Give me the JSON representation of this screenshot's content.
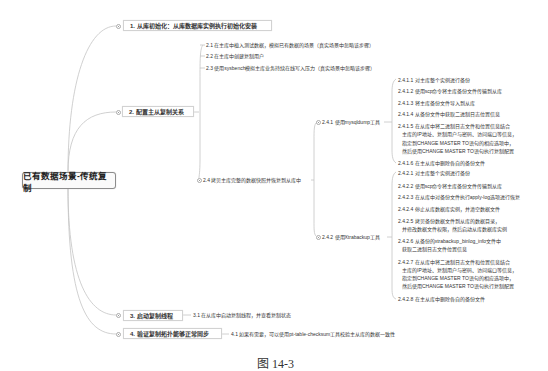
{
  "root": {
    "label": "已有数据场景-传统复制"
  },
  "branches": [
    {
      "label": "1. 从库初始化：从库数据库实例执行初始化安装"
    },
    {
      "label": "2. 配置主从复制关系",
      "children": [
        {
          "label": "2.1 在主库中植入测试数据，模拟已有数据的场景（真实场景中忽略该步骤）"
        },
        {
          "label": "2.2 在主库中创建复制用户"
        },
        {
          "label": "2.3 使用sysbench模拟主库业务持续在线写入压力（真实场景中忽略该步骤）"
        },
        {
          "label": "2.4 拷贝主库完整的数据快照并恢复到从库中",
          "children": [
            {
              "label": "2.4.1 使用mysqldump工具",
              "children": [
                {
                  "lines": [
                    "2.4.1.1 对主库整个实例进行备份"
                  ]
                },
                {
                  "lines": [
                    "2.4.1.2 使用scp命令将主库备份文件传输到从库"
                  ]
                },
                {
                  "lines": [
                    "2.4.1.3 将主库备份文件导入到从库"
                  ]
                },
                {
                  "lines": [
                    "2.4.1.4 从备份文件中获取二进制日志位置信息"
                  ]
                },
                {
                  "lines": [
                    "2.4.1.5 在从库中将二进制日志文件和位置信息结合",
                    "主库的IP地址、复制用户与密码、访问端口等信息，",
                    "指定到CHANGE MASTER TO语句的相应选项中，",
                    "然后使用CHANGE MASTER TO语句执行复制配置"
                  ]
                },
                {
                  "lines": [
                    "2.4.1.6 在主从库中删除各自的备份文件"
                  ]
                }
              ]
            },
            {
              "label": "2.4.2 使用Xtrabackup工具",
              "children": [
                {
                  "lines": [
                    "2.4.2.1 对主库整个实例进行备份"
                  ]
                },
                {
                  "lines": [
                    "2.4.2.2 使用scp命令将主库备份文件传输到从库"
                  ]
                },
                {
                  "lines": [
                    "2.4.2.3 在从库中对备份文件执行apply-log选项进行恢复"
                  ]
                },
                {
                  "lines": [
                    "2.4.2.4 停止从库数据库实例，并清空数据文件"
                  ]
                },
                {
                  "lines": [
                    "2.4.2.5 拷贝备份数据文件到从库的数据目录，",
                    "并修改数据文件权限，然后启动从库数据库实例"
                  ]
                },
                {
                  "lines": [
                    "2.4.2.6 从备份的xtrabackup_binlog_info文件中",
                    "获取二进制日志文件位置信息"
                  ]
                },
                {
                  "lines": [
                    "2.4.2.7 在从库中将二进制日志文件和位置信息结合",
                    "主库的IP地址、复制用户与密码、访问端口等信息，",
                    "指定到CHANGE MASTER TO语句的相应选项中，",
                    "然后使用CHANGE MASTER TO语句执行复制配置"
                  ]
                },
                {
                  "lines": [
                    "2.4.2.8 在主从库中删除各自的备份文件"
                  ]
                }
              ]
            }
          ]
        }
      ]
    },
    {
      "label": "3. 启动复制线程",
      "children": [
        {
          "label": "3.1 在从库中启动复制线程，并查看复制状态"
        }
      ]
    },
    {
      "label": "4. 验证复制拓扑能够正常同步",
      "children": [
        {
          "label": "4.1 如果有需要，可以使用pt-table-checksum工具校验主从库的数据一致性"
        }
      ]
    }
  ],
  "caption": "图 14-3"
}
